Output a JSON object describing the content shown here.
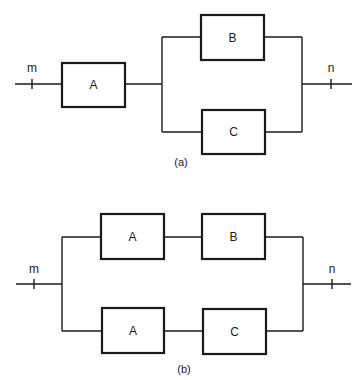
{
  "diagram_a": {
    "caption": "(a)",
    "input_node": "m",
    "output_node": "n",
    "blocks": [
      {
        "id": "A",
        "label": "A"
      },
      {
        "id": "B",
        "label": "B"
      },
      {
        "id": "C",
        "label": "C"
      }
    ],
    "structure": "A in series with (B parallel C)"
  },
  "diagram_b": {
    "caption": "(b)",
    "input_node": "m",
    "output_node": "n",
    "blocks": [
      {
        "id": "A1",
        "label": "A"
      },
      {
        "id": "B",
        "label": "B"
      },
      {
        "id": "A2",
        "label": "A"
      },
      {
        "id": "C",
        "label": "C"
      }
    ],
    "structure": "(A series B) parallel (A series C)"
  },
  "colors": {
    "line": "#1a1a1a",
    "background": "#ffffff"
  }
}
